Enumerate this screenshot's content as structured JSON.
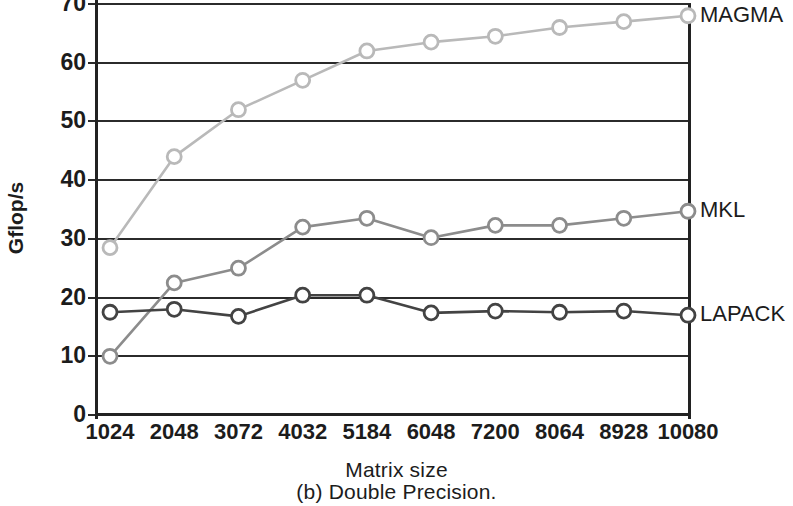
{
  "chart_data": {
    "type": "line",
    "title": "",
    "subtitle": "",
    "caption": "(b) Double Precision.",
    "xlabel": "Matrix size",
    "ylabel": "Gflop/s",
    "categories": [
      "1024",
      "2048",
      "3072",
      "4032",
      "5184",
      "6048",
      "7200",
      "8064",
      "8928",
      "10080"
    ],
    "x": [
      1024,
      2048,
      3072,
      4032,
      5184,
      6048,
      7200,
      8064,
      8928,
      10080
    ],
    "ylim": [
      0,
      70
    ],
    "yticks": [
      0,
      10,
      20,
      30,
      40,
      50,
      60,
      70
    ],
    "ytick_labels": [
      "0",
      "10",
      "20",
      "30",
      "40",
      "50",
      "60",
      "70"
    ],
    "grid": true,
    "grid_axis": "y",
    "legend_position": "right-of-plot-inline",
    "series": [
      {
        "name": "MAGMA",
        "color": "#b9b9b9",
        "marker": "open-circle",
        "values": [
          28.5,
          44.0,
          52.0,
          57.0,
          62.0,
          63.5,
          64.5,
          66.0,
          67.0,
          68.0
        ]
      },
      {
        "name": "MKL",
        "color": "#8c8c8c",
        "marker": "open-circle",
        "values": [
          10.0,
          22.5,
          25.0,
          32.0,
          33.5,
          30.2,
          32.3,
          32.3,
          33.5,
          34.7
        ]
      },
      {
        "name": "LAPACK",
        "color": "#434343",
        "marker": "open-circle",
        "values": [
          17.5,
          18.0,
          16.8,
          20.4,
          20.4,
          17.4,
          17.7,
          17.5,
          17.7,
          17.0
        ]
      }
    ]
  },
  "figure": {
    "y_axis_title": "Gflop/s",
    "x_axis_title": "Matrix size",
    "caption": "(b) Double Precision.",
    "series_labels": [
      "MAGMA",
      "MKL",
      "LAPACK"
    ],
    "ytick_labels": [
      "70",
      "60",
      "50",
      "40",
      "30",
      "20",
      "10",
      "0"
    ],
    "xtick_labels": [
      "1024",
      "2048",
      "3072",
      "4032",
      "5184",
      "6048",
      "7200",
      "8064",
      "8928",
      "10080"
    ],
    "colors": {
      "magma": "#b9b9b9",
      "mkl": "#8c8c8c",
      "lapack": "#434343",
      "axis": "#222222",
      "text": "#1c1c1c",
      "background": "#ffffff"
    }
  }
}
